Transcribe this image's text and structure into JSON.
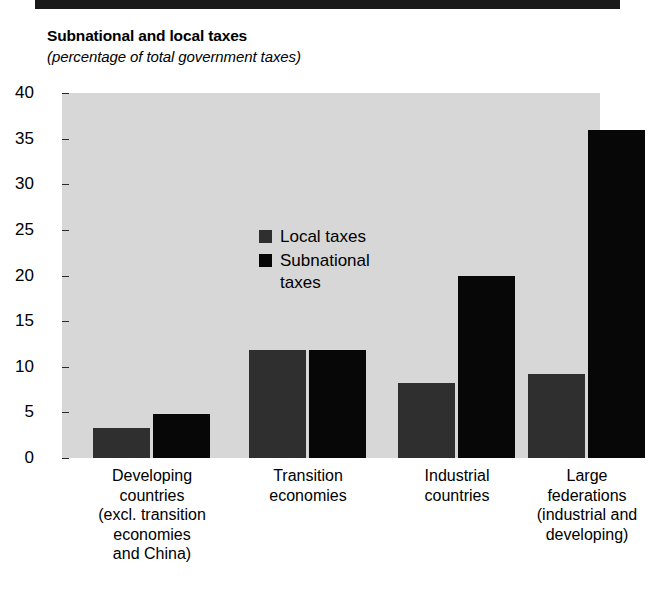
{
  "header": {
    "top_rule": "black-rule"
  },
  "title": {
    "main": "Subnational and local taxes",
    "subtitle": "(percentage of  total government taxes)"
  },
  "legend": {
    "position": "inside-top-left",
    "items": [
      {
        "label": "Local taxes",
        "color": "#2f2f2f",
        "key": "local"
      },
      {
        "label": "Subnational taxes",
        "color": "#070707",
        "key": "sub"
      }
    ]
  },
  "axis": {
    "y_ticks": [
      "0",
      "5",
      "10",
      "15",
      "20",
      "25",
      "30",
      "35",
      "40"
    ],
    "y_min": 0,
    "y_max": 40,
    "y_step": 5
  },
  "colors": {
    "plot_background": "#d7d7d7",
    "local_bar": "#2f2f2f",
    "subnational_bar": "#070707",
    "page_background": "#ffffff",
    "rule": "#1a1a1a"
  },
  "chart_data": {
    "type": "bar",
    "title": "Subnational and local taxes",
    "subtitle": "(percentage of  total government taxes)",
    "xlabel": "",
    "ylabel": "",
    "ylim": [
      0,
      40
    ],
    "yticks": [
      0,
      5,
      10,
      15,
      20,
      25,
      30,
      35,
      40
    ],
    "grid": false,
    "legend_position": "inside top-left",
    "categories": [
      "Developing countries (excl. transition economies and China)",
      "Transition economies",
      "Industrial countries",
      "Large federations (industrial and developing)"
    ],
    "category_lines": [
      [
        "Developing",
        "countries",
        "(excl. transition",
        "economies",
        "and China)"
      ],
      [
        "Transition",
        "economies"
      ],
      [
        "Industrial",
        "countries"
      ],
      [
        "Large",
        "federations",
        "(industrial and",
        "developing)"
      ]
    ],
    "series": [
      {
        "name": "Local taxes",
        "color": "#2f2f2f",
        "values": [
          3.3,
          11.8,
          8.2,
          9.2
        ]
      },
      {
        "name": "Subnational taxes",
        "color": "#070707",
        "values": [
          4.8,
          11.8,
          20.0,
          36.0
        ]
      }
    ]
  }
}
